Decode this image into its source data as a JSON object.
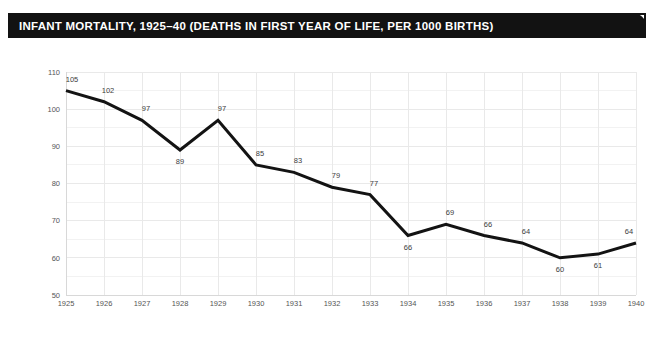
{
  "figure": {
    "title": "INFANT MORTALITY, 1925–40 (DEATHS IN FIRST YEAR OF LIFE, PER 1000 BIRTHS)",
    "frame_color": "#121212",
    "background_color": "#ffffff",
    "title_text_color": "#ffffff"
  },
  "chart_data": {
    "type": "line",
    "title": "INFANT MORTALITY, 1925–40 (DEATHS IN FIRST YEAR OF LIFE, PER 1000 BIRTHS)",
    "xlabel": "",
    "ylabel": "",
    "categories": [
      "1925",
      "1926",
      "1927",
      "1928",
      "1929",
      "1930",
      "1931",
      "1932",
      "1933",
      "1934",
      "1935",
      "1936",
      "1937",
      "1938",
      "1939",
      "1940"
    ],
    "values": [
      105,
      102,
      97,
      89,
      97,
      85,
      83,
      79,
      77,
      66,
      69,
      66,
      64,
      60,
      61,
      64
    ],
    "point_labels": [
      "105",
      "102",
      "97",
      "89",
      "97",
      "85",
      "83",
      "79",
      "77",
      "66",
      "69",
      "66",
      "64",
      "60",
      "61",
      "64"
    ],
    "label_positions": [
      "above",
      "above",
      "above",
      "below",
      "above",
      "above",
      "above",
      "above",
      "above",
      "below",
      "above",
      "above",
      "above",
      "below",
      "below",
      "above"
    ],
    "ylim": [
      50,
      110
    ],
    "ytick_labels": [
      "50",
      "60",
      "70",
      "80",
      "90",
      "100",
      "110"
    ],
    "ytick_values": [
      50,
      60,
      70,
      80,
      90,
      100,
      110
    ],
    "yminor_values": [
      55,
      65,
      75,
      85,
      95,
      105
    ],
    "xtick_labels": [
      "1925",
      "1926",
      "1927",
      "1928",
      "1929",
      "1930",
      "1931",
      "1932",
      "1933",
      "1934",
      "1935",
      "1936",
      "1937",
      "1938",
      "1939",
      "1940"
    ],
    "grid": true,
    "legend": false,
    "series_color": "#131313",
    "grid_color": "#e9e9e9",
    "tick_label_color": "#555555"
  }
}
